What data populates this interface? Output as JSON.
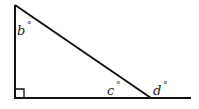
{
  "diagram": {
    "type": "right-triangle-angles",
    "labels": {
      "b": {
        "var": "b",
        "unit": "°"
      },
      "c": {
        "var": "c",
        "unit": "°"
      },
      "d": {
        "var": "d",
        "unit": "°"
      }
    },
    "stroke_color": "#111111"
  }
}
